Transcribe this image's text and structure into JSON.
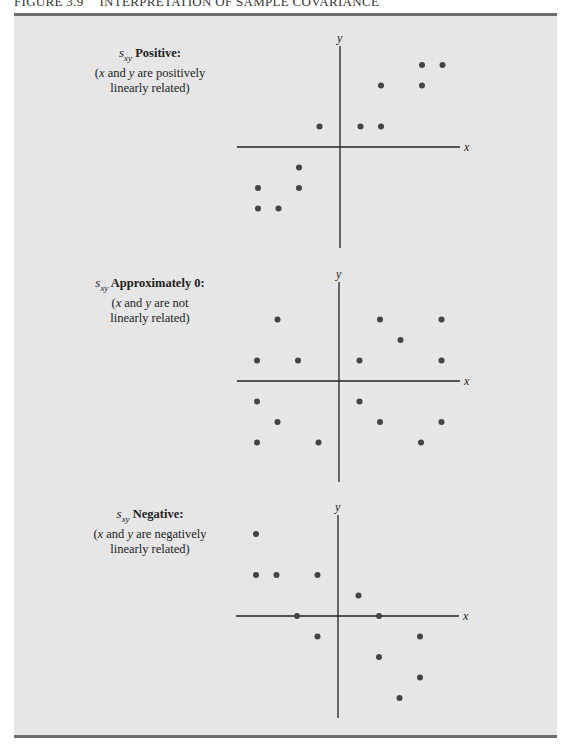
{
  "header": {
    "figure_number": "FIGURE 3.9",
    "title": "INTERPRETATION OF SAMPLE COVARIANCE"
  },
  "panels": [
    {
      "symbol": "s",
      "subscript": "xy",
      "heading": "Positive:",
      "line1_pre": "(",
      "line1_x": "x",
      "line1_mid": " and ",
      "line1_y": "y",
      "line1_post": " are positively",
      "line2": "linearly related)"
    },
    {
      "symbol": "s",
      "subscript": "xy",
      "heading": "Approximately 0:",
      "line1_pre": "(",
      "line1_x": "x",
      "line1_mid": " and ",
      "line1_y": "y",
      "line1_post": " are not",
      "line2": "linearly related)"
    },
    {
      "symbol": "s",
      "subscript": "xy",
      "heading": "Negative:",
      "line1_pre": "(",
      "line1_x": "x",
      "line1_mid": " and ",
      "line1_y": "y",
      "line1_post": " are negatively",
      "line2": "linearly related)"
    }
  ],
  "axis_labels": {
    "x": "x",
    "y": "y"
  },
  "colors": {
    "panel_bg": "#e6e6e6",
    "rule": "#6e6e6e",
    "axis": "#222222",
    "point": "#444444"
  },
  "chart_data": [
    {
      "type": "scatter",
      "title": "s_xy Positive: (x and y are positively linearly related)",
      "xlabel": "x",
      "ylabel": "y",
      "grid": false,
      "note": "coordinates in grid units relative to origin (1 unit ≈ 20px), no tick labels shown",
      "points": [
        [
          4,
          4
        ],
        [
          5,
          4
        ],
        [
          2,
          3
        ],
        [
          4,
          3
        ],
        [
          -1,
          1
        ],
        [
          1,
          1
        ],
        [
          2,
          1
        ],
        [
          -2,
          -1
        ],
        [
          -4,
          -2
        ],
        [
          -2,
          -2
        ],
        [
          -4,
          -3
        ],
        [
          -3,
          -3
        ]
      ]
    },
    {
      "type": "scatter",
      "title": "s_xy Approximately 0: (x and y are not linearly related)",
      "xlabel": "x",
      "ylabel": "y",
      "grid": false,
      "note": "coordinates in grid units relative to origin (1 unit ≈ 20px), no tick labels shown",
      "points": [
        [
          -3,
          3
        ],
        [
          2,
          3
        ],
        [
          5,
          3
        ],
        [
          3,
          2
        ],
        [
          -4,
          1
        ],
        [
          -2,
          1
        ],
        [
          1,
          1
        ],
        [
          5,
          1
        ],
        [
          -4,
          -1
        ],
        [
          1,
          -1
        ],
        [
          -3,
          -2
        ],
        [
          2,
          -2
        ],
        [
          5,
          -2
        ],
        [
          -4,
          -3
        ],
        [
          -1,
          -3
        ],
        [
          4,
          -3
        ]
      ]
    },
    {
      "type": "scatter",
      "title": "s_xy Negative: (x and y are negatively linearly related)",
      "xlabel": "x",
      "ylabel": "y",
      "grid": false,
      "note": "coordinates in grid units relative to origin (1 unit ≈ 20px), no tick labels shown",
      "points": [
        [
          -4,
          4
        ],
        [
          -4,
          2
        ],
        [
          -3,
          2
        ],
        [
          -1,
          2
        ],
        [
          1,
          1
        ],
        [
          -2,
          0
        ],
        [
          2,
          0
        ],
        [
          -1,
          -1
        ],
        [
          4,
          -1
        ],
        [
          2,
          -2
        ],
        [
          4,
          -3
        ],
        [
          3,
          -4
        ]
      ]
    }
  ]
}
